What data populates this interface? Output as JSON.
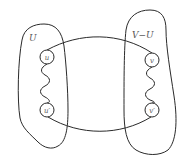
{
  "diagram": {
    "type": "graph-cut",
    "sets": [
      {
        "id": "U",
        "label": "U"
      },
      {
        "id": "V-U",
        "label": "V−U"
      }
    ],
    "nodes": [
      {
        "id": "u",
        "label": "u",
        "set": "U"
      },
      {
        "id": "u_prime",
        "label": "u′",
        "set": "U"
      },
      {
        "id": "v",
        "label": "v",
        "set": "V-U"
      },
      {
        "id": "v_prime",
        "label": "v′",
        "set": "V-U"
      }
    ],
    "edges": [
      {
        "from": "u",
        "to": "v",
        "style": "curved"
      },
      {
        "from": "u_prime",
        "to": "v_prime",
        "style": "curved"
      },
      {
        "from": "u",
        "to": "u_prime",
        "style": "wavy-path"
      },
      {
        "from": "v",
        "to": "v_prime",
        "style": "wavy-path"
      }
    ]
  }
}
